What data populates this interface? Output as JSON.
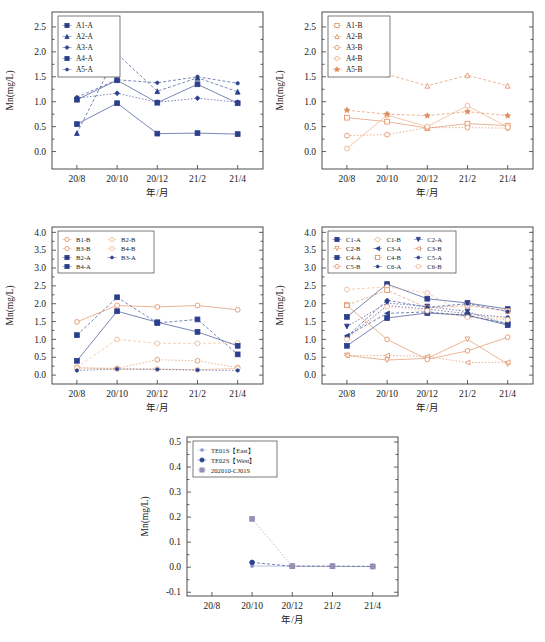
{
  "figure": {
    "y_axis_label": "Mn(mg/L)",
    "x_axis_label": "年/月",
    "x_categories": [
      "20/8",
      "20/10",
      "20/12",
      "21/2",
      "21/4"
    ],
    "colors": {
      "blue": "#2b3f8c",
      "orange": "#e08a5a",
      "navy": "#1f3576",
      "lightorange": "#f0b48b"
    }
  },
  "chart_data": [
    {
      "id": "panel-a-a",
      "type": "line",
      "title": "",
      "xlabel": "年/月",
      "ylabel": "Mn(mg/L)",
      "categories": [
        "20/8",
        "20/10",
        "20/12",
        "21/2",
        "21/4"
      ],
      "ylim": [
        -0.35,
        2.8
      ],
      "yticks": [
        0.0,
        0.5,
        1.0,
        1.5,
        2.0,
        2.5
      ],
      "ytick_labels": [
        "0.0",
        "0.5",
        "1.0",
        "1.5",
        "2.0",
        "2.5"
      ],
      "grid": false,
      "legend_position": "top-left",
      "series": [
        {
          "name": "A1-A",
          "marker": "square",
          "color": "#2b3f8c",
          "values": [
            0.55,
            0.97,
            0.36,
            0.37,
            0.35
          ]
        },
        {
          "name": "A2-A",
          "marker": "triangle",
          "color": "#2b3f8c",
          "values": [
            0.37,
            1.96,
            1.21,
            1.48,
            1.2
          ]
        },
        {
          "name": "A3-A",
          "marker": "diamond",
          "color": "#2b3f8c",
          "values": [
            1.07,
            1.17,
            0.99,
            1.07,
            0.99
          ]
        },
        {
          "name": "A4-A",
          "marker": "square",
          "color": "#2b3f8c",
          "values": [
            1.04,
            1.43,
            0.98,
            1.35,
            0.97
          ]
        },
        {
          "name": "A5-A",
          "marker": "dot",
          "color": "#2b3f8c",
          "values": [
            1.09,
            1.44,
            1.38,
            1.5,
            1.37
          ]
        }
      ]
    },
    {
      "id": "panel-a-b",
      "type": "line",
      "title": "",
      "xlabel": "年/月",
      "ylabel": "Mn(mg/L)",
      "categories": [
        "20/8",
        "20/10",
        "20/12",
        "21/2",
        "21/4"
      ],
      "ylim": [
        -0.35,
        2.8
      ],
      "yticks": [
        0.0,
        0.5,
        1.0,
        1.5,
        2.0,
        2.5
      ],
      "ytick_labels": [
        "0.0",
        "0.5",
        "1.0",
        "1.5",
        "2.0",
        "2.5"
      ],
      "grid": false,
      "legend_position": "top-left",
      "series": [
        {
          "name": "A1-B",
          "marker": "square-open",
          "color": "#e08a5a",
          "values": [
            0.68,
            0.6,
            0.47,
            0.56,
            0.52
          ]
        },
        {
          "name": "A2-B",
          "marker": "triangle-open",
          "color": "#e08a5a",
          "values": [
            1.64,
            1.55,
            1.32,
            1.53,
            1.32
          ]
        },
        {
          "name": "A3-B",
          "marker": "circle-open",
          "color": "#e08a5a",
          "values": [
            0.32,
            0.34,
            0.48,
            0.48,
            0.47
          ]
        },
        {
          "name": "A4-B",
          "marker": "circle-open",
          "color": "#f0a87a",
          "values": [
            0.06,
            0.73,
            0.5,
            0.92,
            0.49
          ]
        },
        {
          "name": "A5-B",
          "marker": "star",
          "color": "#e08a5a",
          "values": [
            0.83,
            0.75,
            0.72,
            0.8,
            0.72
          ]
        }
      ]
    },
    {
      "id": "panel-b",
      "type": "line",
      "title": "",
      "xlabel": "年/月",
      "ylabel": "Mn(mg/L)",
      "categories": [
        "20/8",
        "20/10",
        "20/12",
        "21/2",
        "21/4"
      ],
      "ylim": [
        -0.25,
        4.15
      ],
      "yticks": [
        0.0,
        0.5,
        1.0,
        1.5,
        2.0,
        2.5,
        3.0,
        3.5,
        4.0
      ],
      "ytick_labels": [
        "0.0",
        "0.5",
        "1.0",
        "1.5",
        "2.0",
        "2.5",
        "3.0",
        "3.5",
        "4.0"
      ],
      "grid": false,
      "legend_position": "top-left",
      "series": [
        {
          "name": "B1-B",
          "marker": "circle-open",
          "color": "#e08a5a",
          "values": [
            1.49,
            1.95,
            1.91,
            1.95,
            1.83
          ]
        },
        {
          "name": "B2-B",
          "marker": "circle-open",
          "color": "#f0b48b",
          "values": [
            0.22,
            1.0,
            0.89,
            0.89,
            0.9
          ]
        },
        {
          "name": "B3-B",
          "marker": "circle-open",
          "color": "#e08a5a",
          "values": [
            0.21,
            0.19,
            0.43,
            0.4,
            0.21
          ]
        },
        {
          "name": "B4-B",
          "marker": "circle-open",
          "color": "#f0b48b",
          "values": [
            0.2,
            0.17,
            0.17,
            0.15,
            0.19
          ]
        },
        {
          "name": "B2-A",
          "marker": "square",
          "color": "#2b3f8c",
          "values": [
            1.12,
            2.18,
            1.46,
            1.56,
            0.58
          ]
        },
        {
          "name": "B3-A",
          "marker": "dot",
          "color": "#2b3f8c",
          "values": [
            0.13,
            0.17,
            0.16,
            0.14,
            0.13
          ]
        },
        {
          "name": "B4-A",
          "marker": "square",
          "color": "#2b3f8c",
          "values": [
            0.4,
            1.79,
            1.48,
            1.21,
            0.82
          ]
        }
      ]
    },
    {
      "id": "panel-c",
      "type": "line",
      "title": "",
      "xlabel": "年/月",
      "ylabel": "Mn(mg/L)",
      "categories": [
        "20/8",
        "20/10",
        "20/12",
        "21/2",
        "21/4"
      ],
      "ylim": [
        -0.25,
        4.15
      ],
      "yticks": [
        0.0,
        0.5,
        1.0,
        1.5,
        2.0,
        2.5,
        3.0,
        3.5,
        4.0
      ],
      "ytick_labels": [
        "0.0",
        "0.5",
        "1.0",
        "1.5",
        "2.0",
        "2.5",
        "3.0",
        "3.5",
        "4.0"
      ],
      "grid": false,
      "legend_position": "top-left",
      "series": [
        {
          "name": "C1-A",
          "marker": "square",
          "color": "#2b3f8c",
          "values": [
            1.63,
            2.55,
            2.14,
            2.02,
            1.85
          ]
        },
        {
          "name": "C1-B",
          "marker": "circle-open",
          "color": "#f0b48b",
          "values": [
            2.4,
            2.47,
            2.3,
            1.7,
            1.58
          ]
        },
        {
          "name": "C2-A",
          "marker": "triangle-down",
          "color": "#2b3f8c",
          "values": [
            1.36,
            2.02,
            1.92,
            1.78,
            1.42
          ]
        },
        {
          "name": "C2-B",
          "marker": "triangle-down-open",
          "color": "#e08a5a",
          "values": [
            0.55,
            0.42,
            0.47,
            1.0,
            0.31
          ]
        },
        {
          "name": "C3-A",
          "marker": "triangle-left",
          "color": "#2b3f8c",
          "values": [
            1.1,
            1.73,
            1.77,
            1.66,
            1.45
          ]
        },
        {
          "name": "C3-B",
          "marker": "triangle-left-open",
          "color": "#e08a5a",
          "values": [
            0.55,
            0.55,
            0.52,
            0.35,
            0.36
          ]
        },
        {
          "name": "C4-A",
          "marker": "square",
          "color": "#2b3f8c",
          "values": [
            0.82,
            1.6,
            1.74,
            1.68,
            1.4
          ]
        },
        {
          "name": "C4-B",
          "marker": "square-open",
          "color": "#e08a5a",
          "values": [
            1.96,
            2.38,
            1.88,
            1.95,
            1.8
          ]
        },
        {
          "name": "C5-A",
          "marker": "dot",
          "color": "#2b3f8c",
          "values": [
            1.05,
            1.95,
            1.85,
            1.72,
            1.62
          ]
        },
        {
          "name": "C5-B",
          "marker": "circle-open",
          "color": "#e08a5a",
          "values": [
            1.95,
            1.0,
            0.44,
            0.68,
            1.06
          ]
        },
        {
          "name": "C6-A",
          "marker": "dot",
          "color": "#2b3f8c",
          "values": [
            1.08,
            2.1,
            1.9,
            2.0,
            1.78
          ]
        },
        {
          "name": "C6-B",
          "marker": "circle-open",
          "color": "#f0b48b",
          "values": [
            1.0,
            1.92,
            1.8,
            1.62,
            1.55
          ]
        }
      ]
    },
    {
      "id": "panel-d",
      "type": "line",
      "title": "",
      "xlabel": "年/月",
      "ylabel": "Mn(mg/L)",
      "categories": [
        "20/8",
        "20/10",
        "20/12",
        "21/2",
        "21/4"
      ],
      "ylim": [
        -0.115,
        0.52
      ],
      "yticks": [
        -0.1,
        0.0,
        0.1,
        0.2,
        0.3,
        0.4,
        0.5
      ],
      "ytick_labels": [
        "-0.1",
        "0.0",
        "0.1",
        "0.2",
        "0.3",
        "0.4",
        "0.5"
      ],
      "grid": false,
      "legend_position": "top-left",
      "series": [
        {
          "name": "TE01S【East】",
          "marker": "dot",
          "color": "#8f9ccc",
          "values": [
            null,
            0.005,
            0.004,
            0.003,
            0.003
          ]
        },
        {
          "name": "TE02S【West】",
          "marker": "circle",
          "color": "#2b3f8c",
          "values": [
            null,
            0.019,
            0.004,
            0.004,
            0.003
          ]
        },
        {
          "name": "202010-CJ01S",
          "marker": "square",
          "color": "#9a8fb5",
          "values": [
            null,
            0.193,
            0.004,
            0.004,
            0.003
          ]
        }
      ]
    }
  ]
}
